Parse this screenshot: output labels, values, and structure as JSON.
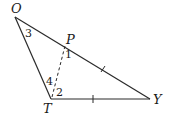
{
  "diagram": {
    "type": "triangle",
    "points": {
      "O": {
        "label": "O",
        "x": 15,
        "y": 17
      },
      "T": {
        "label": "T",
        "x": 51,
        "y": 99
      },
      "Y": {
        "label": "Y",
        "x": 150,
        "y": 99
      },
      "P": {
        "label": "P",
        "x": 65,
        "y": 45
      }
    },
    "angles": {
      "a1": "1",
      "a2": "2",
      "a3": "3",
      "a4": "4"
    },
    "segments": [
      {
        "from": "O",
        "to": "T",
        "style": "solid"
      },
      {
        "from": "T",
        "to": "Y",
        "style": "solid",
        "tick": 1
      },
      {
        "from": "O",
        "to": "Y",
        "style": "solid"
      },
      {
        "from": "P",
        "to": "Y",
        "style": "solid",
        "tick": 1
      },
      {
        "from": "T",
        "to": "P",
        "style": "dashed"
      }
    ],
    "colors": {
      "stroke": "#2a2a2a",
      "background": "#ffffff"
    }
  }
}
